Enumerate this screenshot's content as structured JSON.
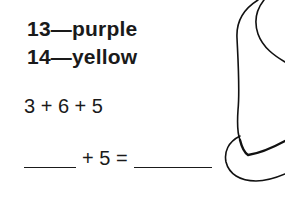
{
  "color_key": [
    {
      "number": "13",
      "color": "purple",
      "label": "13—purple"
    },
    {
      "number": "14",
      "color": "yellow",
      "label": "14—yellow"
    }
  ],
  "problem": {
    "expression": "3 + 6 + 5",
    "equation_middle": "+ 5 ="
  },
  "illustration": {
    "name": "hat-outline"
  }
}
